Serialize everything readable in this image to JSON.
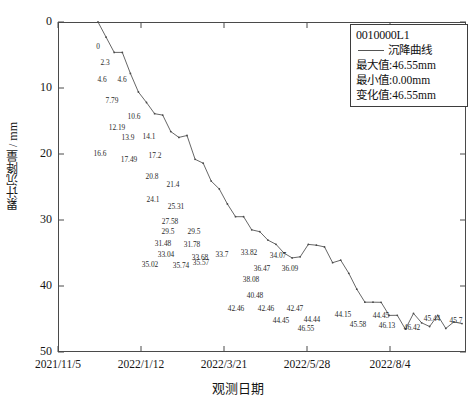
{
  "chart_data": {
    "type": "line",
    "title": "",
    "xlabel": "观测日期",
    "ylabel": "累计沉降量 / mm",
    "ylim": [
      0,
      50
    ],
    "y_inverted": true,
    "y_ticks": [
      0,
      10,
      20,
      30,
      40,
      50
    ],
    "x_ticks": [
      "2021/11/5",
      "2022/1/12",
      "2022/3/21",
      "2022/5/28",
      "2022/8/4"
    ],
    "grid": false,
    "legend_position": "top-right",
    "series": [
      {
        "name": "沉降曲线",
        "color": "#555555",
        "values": [
          0,
          2.3,
          4.6,
          4.6,
          7.79,
          10.6,
          12.19,
          13.9,
          14.1,
          16.6,
          17.49,
          17.2,
          20.8,
          21.4,
          24.1,
          25.31,
          27.58,
          29.5,
          29.5,
          31.48,
          31.78,
          33.04,
          33.68,
          35.02,
          35.74,
          35.57,
          33.7,
          33.82,
          34.07,
          36.47,
          36.09,
          38.08,
          40.48,
          42.46,
          42.46,
          42.47,
          44.45,
          44.44,
          46.55,
          44.15,
          45.58,
          46.13,
          44.45,
          46.42,
          45.44,
          45.7
        ]
      }
    ],
    "point_labels": [
      {
        "text": "0",
        "x": 98,
        "y": 46
      },
      {
        "text": "2.3",
        "x": 105,
        "y": 62
      },
      {
        "text": "4.6",
        "x": 102,
        "y": 79
      },
      {
        "text": "4.6",
        "x": 122,
        "y": 79
      },
      {
        "text": "7.79",
        "x": 112,
        "y": 100
      },
      {
        "text": "10.6",
        "x": 134,
        "y": 116
      },
      {
        "text": "12.19",
        "x": 117,
        "y": 127
      },
      {
        "text": "13.9",
        "x": 128,
        "y": 137
      },
      {
        "text": "14.1",
        "x": 149,
        "y": 136
      },
      {
        "text": "16.6",
        "x": 100,
        "y": 153
      },
      {
        "text": "17.49",
        "x": 129,
        "y": 159
      },
      {
        "text": "17.2",
        "x": 155,
        "y": 155
      },
      {
        "text": "20.8",
        "x": 152,
        "y": 176
      },
      {
        "text": "21.4",
        "x": 173,
        "y": 184
      },
      {
        "text": "24.1",
        "x": 153,
        "y": 199
      },
      {
        "text": "25.31",
        "x": 176,
        "y": 206
      },
      {
        "text": "27.58",
        "x": 170,
        "y": 221
      },
      {
        "text": "29.5",
        "x": 168,
        "y": 231
      },
      {
        "text": "29.5",
        "x": 194,
        "y": 231
      },
      {
        "text": "31.48",
        "x": 163,
        "y": 243
      },
      {
        "text": "31.78",
        "x": 192,
        "y": 244
      },
      {
        "text": "33.04",
        "x": 166,
        "y": 254
      },
      {
        "text": "33.68",
        "x": 200,
        "y": 257
      },
      {
        "text": "35.02",
        "x": 150,
        "y": 264
      },
      {
        "text": "35.74",
        "x": 181,
        "y": 265
      },
      {
        "text": "35.57",
        "x": 201,
        "y": 262
      },
      {
        "text": "33.7",
        "x": 222,
        "y": 254
      },
      {
        "text": "33.82",
        "x": 249,
        "y": 252
      },
      {
        "text": "34.07",
        "x": 278,
        "y": 255
      },
      {
        "text": "36.47",
        "x": 262,
        "y": 268
      },
      {
        "text": "36.09",
        "x": 290,
        "y": 268
      },
      {
        "text": "38.08",
        "x": 251,
        "y": 279
      },
      {
        "text": "40.48",
        "x": 255,
        "y": 295
      },
      {
        "text": "42.46",
        "x": 236,
        "y": 308
      },
      {
        "text": "42.46",
        "x": 266,
        "y": 308
      },
      {
        "text": "42.47",
        "x": 295,
        "y": 308
      },
      {
        "text": "44.45",
        "x": 281,
        "y": 320
      },
      {
        "text": "44.44",
        "x": 312,
        "y": 319
      },
      {
        "text": "46.55",
        "x": 306,
        "y": 328
      },
      {
        "text": "44.15",
        "x": 343,
        "y": 314
      },
      {
        "text": "45.58",
        "x": 358,
        "y": 324
      },
      {
        "text": "46.13",
        "x": 387,
        "y": 325
      },
      {
        "text": "44.45",
        "x": 381,
        "y": 315
      },
      {
        "text": "46.42",
        "x": 412,
        "y": 327
      },
      {
        "text": "45.44",
        "x": 432,
        "y": 318
      },
      {
        "text": "45.7",
        "x": 456,
        "y": 320
      }
    ]
  },
  "legend": {
    "id": "0010000L1",
    "series_label": "沉降曲线",
    "max_row": "最大值:46.55mm",
    "min_row": "最小值:0.00mm",
    "change_row": "变化值:46.55mm"
  },
  "axes": {
    "y_title": "累计沉降量 / mm",
    "x_title": "观测日期",
    "y_tick_labels": [
      "0",
      "10",
      "20",
      "30",
      "40",
      "50"
    ],
    "x_tick_labels": [
      "2021/11/5",
      "2022/1/12",
      "2022/3/21",
      "2022/5/28",
      "2022/8/4"
    ]
  }
}
